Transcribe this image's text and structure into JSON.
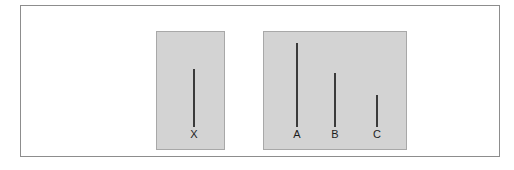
{
  "figure": {
    "kind": "line-length-judgment-task",
    "panels": [
      {
        "id": "standard",
        "name": "standard-panel",
        "lines": [
          {
            "label": "X",
            "height_px": 58,
            "x_px": 37
          }
        ]
      },
      {
        "id": "comparison",
        "name": "comparison-panel",
        "lines": [
          {
            "label": "A",
            "height_px": 84,
            "x_px": 33
          },
          {
            "label": "B",
            "height_px": 54,
            "x_px": 71
          },
          {
            "label": "C",
            "height_px": 32,
            "x_px": 113
          }
        ]
      }
    ]
  },
  "colors": {
    "panel_fill": "#d3d3d3",
    "panel_border": "#a8a8a8",
    "frame_border": "#8d8d8d",
    "line_stroke": "#3a3a3a",
    "label_text": "#1d1d1d",
    "background": "#ffffff"
  },
  "chart_data": {
    "type": "bar",
    "title": "",
    "subtitle": "",
    "xlabel": "",
    "ylabel": "",
    "orientation": "vertical",
    "grid": false,
    "legend": "none",
    "categories": [
      "X",
      "A",
      "B",
      "C"
    ],
    "values": [
      58,
      84,
      54,
      32
    ],
    "units": "pixels",
    "ylim": [
      0,
      90
    ],
    "groups": [
      {
        "name": "standard",
        "categories": [
          "X"
        ],
        "values": [
          58
        ]
      },
      {
        "name": "comparison",
        "categories": [
          "A",
          "B",
          "C"
        ],
        "values": [
          84,
          54,
          32
        ]
      }
    ],
    "annotations": []
  }
}
